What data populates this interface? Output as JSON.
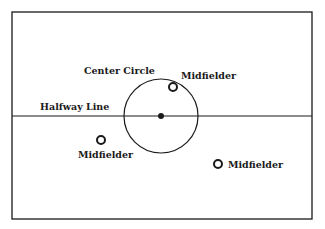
{
  "diagram": {
    "type": "soccer-field-half-layout",
    "colors": {
      "line": "#1a1a1a",
      "background": "#ffffff"
    },
    "field_border": {
      "x": 12,
      "y": 12,
      "width": 300,
      "height": 207
    },
    "halfway_line": {
      "label": "Halfway Line",
      "y": 116,
      "label_x": 40,
      "label_y": 110
    },
    "center_circle": {
      "label": "Center Circle",
      "cx": 161,
      "cy": 116,
      "r": 37,
      "label_x": 84,
      "label_y": 74
    },
    "center_spot": {
      "cx": 161,
      "cy": 116,
      "r": 3
    },
    "players": [
      {
        "role": "Midfielder",
        "cx": 173,
        "cy": 87,
        "label_x": 181,
        "label_y": 79
      },
      {
        "role": "Midfielder",
        "cx": 101,
        "cy": 140,
        "label_x": 78,
        "label_y": 158
      },
      {
        "role": "Midfielder",
        "cx": 218,
        "cy": 164,
        "label_x": 228,
        "label_y": 168
      }
    ]
  }
}
